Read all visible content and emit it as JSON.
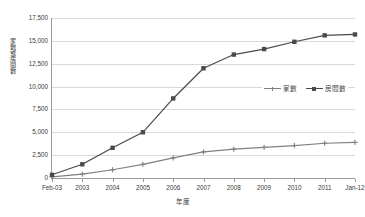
{
  "chart_data": {
    "type": "line",
    "title": "",
    "xlabel": "年度",
    "ylabel": "家數或房間數",
    "categories": [
      "Feb-03",
      "2003",
      "2004",
      "2005",
      "2006",
      "2007",
      "2008",
      "2009",
      "2010",
      "2011",
      "Jan-12"
    ],
    "series": [
      {
        "name": "家數",
        "color": "#808080",
        "marker": "plus",
        "values": [
          130,
          420,
          900,
          1500,
          2200,
          2850,
          3150,
          3350,
          3550,
          3800,
          3900
        ]
      },
      {
        "name": "房間數",
        "color": "#4a4a4a",
        "marker": "square",
        "values": [
          350,
          1500,
          3300,
          5000,
          8700,
          12000,
          13500,
          14100,
          14900,
          15600,
          15700
        ]
      }
    ],
    "ylim": [
      0,
      17500
    ],
    "ytick_values": [
      0,
      2500,
      5000,
      7500,
      10000,
      12500,
      15000,
      17500
    ],
    "ytick_labels": [
      "0",
      "2,500",
      "5,000",
      "7,500",
      "10,000",
      "12,500",
      "15,000",
      "17,500"
    ],
    "grid": "horizontal",
    "legend_position": "inside-right",
    "plot_background": "#ffffff",
    "gridline_color": "#d9d9d9",
    "axis_color": "#9a9a9a"
  }
}
